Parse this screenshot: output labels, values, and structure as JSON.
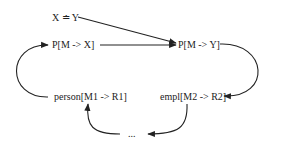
{
  "nodes": {
    "equality": {
      "label": "X ≐ Y",
      "x": 52,
      "y": 21
    },
    "p_m_x": {
      "label": "P[M -> X]",
      "x": 52,
      "y": 48
    },
    "p_m_y": {
      "label": "P[M -> Y]",
      "x": 178,
      "y": 48
    },
    "person": {
      "label": "person[M1 -> R1]",
      "x": 54,
      "y": 100
    },
    "empl": {
      "label": "empl[M2 -> R2]",
      "x": 160,
      "y": 100
    },
    "ellipsis": {
      "label": "...",
      "x": 128,
      "y": 137
    }
  },
  "edges": [
    {
      "from": "equality",
      "to": "p_m_y",
      "shape": "straight"
    },
    {
      "from": "p_m_x",
      "to": "p_m_y",
      "shape": "straight"
    },
    {
      "from": "p_m_y",
      "to": "empl",
      "shape": "curve"
    },
    {
      "from": "empl",
      "to": "ellipsis",
      "shape": "curve"
    },
    {
      "from": "ellipsis",
      "to": "person",
      "shape": "curve"
    },
    {
      "from": "person",
      "to": "p_m_x",
      "shape": "curve"
    }
  ],
  "colors": {
    "stroke": "#222222",
    "text": "#222222",
    "background": "#ffffff"
  }
}
